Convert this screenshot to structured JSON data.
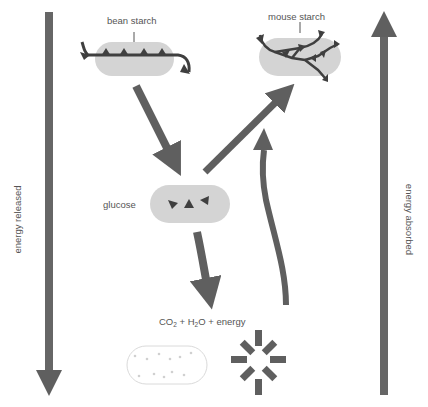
{
  "labels": {
    "bean_starch": "bean starch",
    "mouse_starch": "mouse starch",
    "glucose": "glucose",
    "products": {
      "co": "CO",
      "co_sub": "2",
      "plus1": " + H",
      "h_sub": "2",
      "rest": "O + energy"
    },
    "energy_released": "energy released",
    "energy_absorbed": "energy absorbed"
  },
  "colors": {
    "arrow": "#5f5f5f",
    "molecule_fill": "#d4d4d4",
    "chain": "#3f3f3f",
    "cell_outline": "#d8d8d8",
    "text": "#555555"
  },
  "nodes": [
    {
      "id": "bean-starch",
      "label": "bean starch"
    },
    {
      "id": "mouse-starch",
      "label": "mouse starch"
    },
    {
      "id": "glucose",
      "label": "glucose"
    },
    {
      "id": "products",
      "label": "CO2 + H2O + energy"
    },
    {
      "id": "cell",
      "label": ""
    },
    {
      "id": "sun",
      "label": ""
    }
  ],
  "edges": [
    {
      "from": "bean-starch",
      "to": "glucose"
    },
    {
      "from": "glucose",
      "to": "mouse-starch"
    },
    {
      "from": "glucose",
      "to": "products"
    },
    {
      "from": "products",
      "to": "mouse-starch"
    }
  ]
}
